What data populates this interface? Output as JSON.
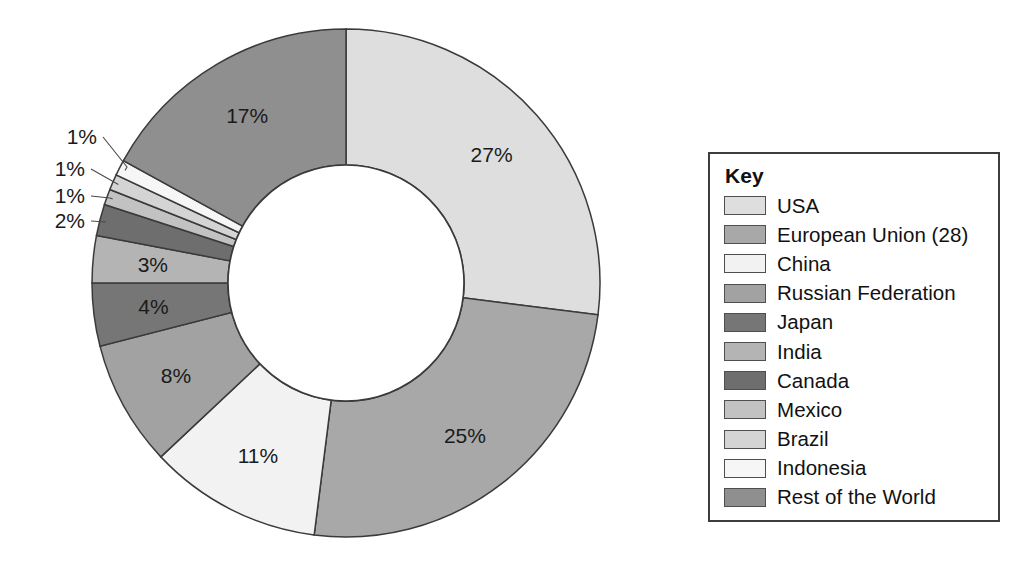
{
  "legend": {
    "title": "Key",
    "border_color": "#3d3d3d"
  },
  "chart_data": {
    "type": "pie",
    "variant": "donut",
    "title": "",
    "subtitle": "",
    "xlabel": "",
    "ylabel": "",
    "legend_position": "right",
    "legend_title": "Key",
    "grid": false,
    "units": "percent",
    "start_angle_deg": 0,
    "direction": "clockwise",
    "inner_radius_ratio": 0.465,
    "total": 100,
    "categories": [
      "USA",
      "European Union (28)",
      "China",
      "Russian Federation",
      "Japan",
      "India",
      "Canada",
      "Mexico",
      "Brazil",
      "Indonesia",
      "Rest of the World"
    ],
    "values": [
      27,
      25,
      11,
      8,
      4,
      3,
      2,
      1,
      1,
      1,
      17
    ],
    "labels": [
      "27%",
      "25%",
      "11%",
      "8%",
      "4%",
      "3%",
      "2%",
      "1%",
      "1%",
      "1%",
      "17%"
    ],
    "colors": [
      "#dedede",
      "#a8a8a8",
      "#f2f2f2",
      "#a2a2a2",
      "#767676",
      "#b4b4b4",
      "#6e6e6e",
      "#c2c2c2",
      "#d4d4d4",
      "#f6f6f6",
      "#8f8f8f"
    ],
    "slices": [
      {
        "name": "USA",
        "value": 27,
        "label": "27%",
        "color": "#dedede",
        "label_placement": "inside"
      },
      {
        "name": "European Union (28)",
        "value": 25,
        "label": "25%",
        "color": "#a8a8a8",
        "label_placement": "inside"
      },
      {
        "name": "China",
        "value": 11,
        "label": "11%",
        "color": "#f2f2f2",
        "label_placement": "inside"
      },
      {
        "name": "Russian Federation",
        "value": 8,
        "label": "8%",
        "color": "#a2a2a2",
        "label_placement": "inside"
      },
      {
        "name": "Japan",
        "value": 4,
        "label": "4%",
        "color": "#767676",
        "label_placement": "inside"
      },
      {
        "name": "India",
        "value": 3,
        "label": "3%",
        "color": "#b4b4b4",
        "label_placement": "inside"
      },
      {
        "name": "Canada",
        "value": 2,
        "label": "2%",
        "color": "#6e6e6e",
        "label_placement": "callout"
      },
      {
        "name": "Mexico",
        "value": 1,
        "label": "1%",
        "color": "#c2c2c2",
        "label_placement": "callout"
      },
      {
        "name": "Brazil",
        "value": 1,
        "label": "1%",
        "color": "#d4d4d4",
        "label_placement": "callout"
      },
      {
        "name": "Indonesia",
        "value": 1,
        "label": "1%",
        "color": "#f6f6f6",
        "label_placement": "callout"
      },
      {
        "name": "Rest of the World",
        "value": 17,
        "label": "17%",
        "color": "#8f8f8f",
        "label_placement": "inside"
      }
    ]
  },
  "ghost_text": {
    "lines": [
      "countries",
      "and distribution",
      "be the for century",
      "emissions",
      "the reserves",
      "considered",
      "countries",
      "which shall be used to",
      "have been as from",
      "its all nations"
    ]
  }
}
